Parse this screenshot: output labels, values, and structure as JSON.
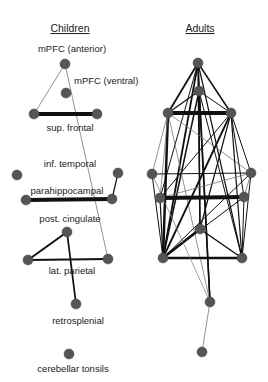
{
  "panels": [
    {
      "id": "children",
      "title": "Children",
      "title_pos": [
        70,
        32
      ],
      "nodes": [
        {
          "id": "mpfc_ant",
          "label": "mPFC (anterior)",
          "x": 65,
          "y": 64
        },
        {
          "id": "mpfc_ven",
          "label": "mPFC (ventral)",
          "x": 66,
          "y": 93
        },
        {
          "id": "supf_l",
          "label": "sup. frontal",
          "x": 34,
          "y": 114
        },
        {
          "id": "supf_r",
          "label": "",
          "x": 97,
          "y": 114
        },
        {
          "id": "inft_l",
          "label": "inf. temporal",
          "x": 17,
          "y": 175
        },
        {
          "id": "inft_r",
          "label": "",
          "x": 118,
          "y": 173
        },
        {
          "id": "parah_l",
          "label": "parahippocampal",
          "x": 26,
          "y": 200
        },
        {
          "id": "parah_r",
          "label": "",
          "x": 112,
          "y": 199
        },
        {
          "id": "postc",
          "label": "post. cingulate",
          "x": 67,
          "y": 232
        },
        {
          "id": "latp_l",
          "label": "lat. parietal",
          "x": 28,
          "y": 260
        },
        {
          "id": "latp_r",
          "label": "",
          "x": 108,
          "y": 259
        },
        {
          "id": "retro",
          "label": "retrosplenial",
          "x": 76,
          "y": 304
        },
        {
          "id": "cereb",
          "label": "cerebellar tonsils",
          "x": 69,
          "y": 354
        }
      ],
      "edges": [
        {
          "from": "mpfc_ant",
          "to": "supf_l",
          "w": 0.8
        },
        {
          "from": "mpfc_ant",
          "to": "latp_r",
          "w": 0.8
        },
        {
          "from": "supf_l",
          "to": "supf_r",
          "w": 4
        },
        {
          "from": "inft_r",
          "to": "parah_r",
          "w": 1.2
        },
        {
          "from": "parah_l",
          "to": "parah_r",
          "w": 4
        },
        {
          "from": "postc",
          "to": "latp_l",
          "w": 2
        },
        {
          "from": "postc",
          "to": "retro",
          "w": 1.8
        },
        {
          "from": "latp_l",
          "to": "latp_r",
          "w": 2
        }
      ]
    },
    {
      "id": "adults",
      "title": "Adults",
      "title_pos": [
        200,
        32
      ],
      "nodes": [
        {
          "id": "mpfc_ant",
          "x": 198,
          "y": 63
        },
        {
          "id": "mpfc_ven",
          "x": 199,
          "y": 91
        },
        {
          "id": "supf_l",
          "x": 168,
          "y": 113
        },
        {
          "id": "supf_r",
          "x": 231,
          "y": 113
        },
        {
          "id": "inft_l",
          "x": 152,
          "y": 174
        },
        {
          "id": "inft_r",
          "x": 251,
          "y": 173
        },
        {
          "id": "parah_l",
          "x": 160,
          "y": 198
        },
        {
          "id": "parah_r",
          "x": 244,
          "y": 197
        },
        {
          "id": "postc",
          "x": 200,
          "y": 229
        },
        {
          "id": "latp_l",
          "x": 163,
          "y": 258
        },
        {
          "id": "latp_r",
          "x": 242,
          "y": 258
        },
        {
          "id": "retro",
          "x": 210,
          "y": 302
        },
        {
          "id": "cereb",
          "x": 202,
          "y": 352
        }
      ],
      "edges": [
        {
          "from": "mpfc_ant",
          "to": "supf_l",
          "w": 1.8
        },
        {
          "from": "mpfc_ant",
          "to": "supf_r",
          "w": 1.5
        },
        {
          "from": "mpfc_ant",
          "to": "latp_l",
          "w": 1.8
        },
        {
          "from": "mpfc_ant",
          "to": "postc",
          "w": 1.5
        },
        {
          "from": "mpfc_ant",
          "to": "retro",
          "w": 1.5
        },
        {
          "from": "mpfc_ant",
          "to": "latp_r",
          "w": 1.2
        },
        {
          "from": "mpfc_ant",
          "to": "parah_l",
          "w": 1
        },
        {
          "from": "mpfc_ven",
          "to": "supf_l",
          "w": 1.2
        },
        {
          "from": "mpfc_ven",
          "to": "supf_r",
          "w": 1
        },
        {
          "from": "mpfc_ven",
          "to": "latp_l",
          "w": 1.5
        },
        {
          "from": "mpfc_ven",
          "to": "postc",
          "w": 1.2
        },
        {
          "from": "mpfc_ven",
          "to": "retro",
          "w": 1.5
        },
        {
          "from": "mpfc_ven",
          "to": "latp_r",
          "w": 1
        },
        {
          "from": "supf_l",
          "to": "supf_r",
          "w": 4
        },
        {
          "from": "supf_l",
          "to": "latp_l",
          "w": 2.5
        },
        {
          "from": "supf_l",
          "to": "inft_l",
          "w": 0.8
        },
        {
          "from": "supf_l",
          "to": "inft_r",
          "w": 0.8
        },
        {
          "from": "supf_l",
          "to": "parah_l",
          "w": 0.8
        },
        {
          "from": "supf_l",
          "to": "retro",
          "w": 0.8
        },
        {
          "from": "supf_r",
          "to": "inft_r",
          "w": 1
        },
        {
          "from": "supf_r",
          "to": "parah_r",
          "w": 1
        },
        {
          "from": "supf_r",
          "to": "latp_l",
          "w": 1.8
        },
        {
          "from": "supf_r",
          "to": "latp_r",
          "w": 1.2
        },
        {
          "from": "supf_r",
          "to": "postc",
          "w": 1.2
        },
        {
          "from": "supf_r",
          "to": "parah_l",
          "w": 1
        },
        {
          "from": "inft_l",
          "to": "inft_r",
          "w": 1.2
        },
        {
          "from": "inft_l",
          "to": "latp_l",
          "w": 1
        },
        {
          "from": "inft_r",
          "to": "parah_l",
          "w": 0.8
        },
        {
          "from": "inft_r",
          "to": "parah_r",
          "w": 0.8
        },
        {
          "from": "inft_r",
          "to": "latp_l",
          "w": 1
        },
        {
          "from": "inft_r",
          "to": "latp_r",
          "w": 1
        },
        {
          "from": "parah_l",
          "to": "parah_r",
          "w": 4
        },
        {
          "from": "parah_l",
          "to": "latp_l",
          "w": 1.2
        },
        {
          "from": "parah_r",
          "to": "latp_l",
          "w": 1
        },
        {
          "from": "parah_r",
          "to": "latp_r",
          "w": 1
        },
        {
          "from": "postc",
          "to": "latp_l",
          "w": 2.5
        },
        {
          "from": "postc",
          "to": "latp_r",
          "w": 1.5
        },
        {
          "from": "latp_l",
          "to": "latp_r",
          "w": 2.5
        },
        {
          "from": "inft_l",
          "to": "retro",
          "w": 0.7
        },
        {
          "from": "retro",
          "to": "cereb",
          "w": 0.8
        }
      ]
    }
  ],
  "colors": {
    "node": "#555555",
    "edge": "#111111",
    "text": "#222222"
  }
}
